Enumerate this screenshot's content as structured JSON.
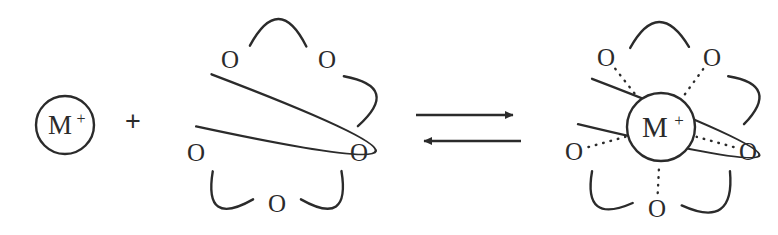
{
  "diagram": {
    "background_color": "#ffffff",
    "line_color": "#2b2b2b",
    "stroke_width": 2.4,
    "reactants": {
      "cation": {
        "label": "M",
        "charge": "+",
        "full_label": "M+",
        "center": {
          "x": 65,
          "y": 125
        },
        "radius": 29
      },
      "plus_operator": {
        "symbol": "+",
        "center": {
          "x": 133,
          "y": 121
        },
        "size": 27
      },
      "crown_ether": {
        "name": "crown-ether-ring",
        "oxygen_label": "O",
        "oxygen_count": 5,
        "center": {
          "x": 277,
          "y": 122
        },
        "radius": 81,
        "oxygen_positions": [
          {
            "name": "oxygen-top-left",
            "x": 230,
            "y": 59
          },
          {
            "name": "oxygen-top-right",
            "x": 327,
            "y": 59
          },
          {
            "name": "oxygen-left",
            "x": 196,
            "y": 152
          },
          {
            "name": "oxygen-right",
            "x": 359,
            "y": 152
          },
          {
            "name": "oxygen-bottom",
            "x": 277,
            "y": 203
          }
        ]
      }
    },
    "arrows": {
      "name": "equilibrium-arrows",
      "type": "reversible",
      "forward": {
        "x1": 416,
        "y1": 115,
        "x2": 521,
        "y2": 115,
        "direction": "right"
      },
      "reverse": {
        "x1": 521,
        "y1": 141,
        "x2": 416,
        "y2": 141,
        "direction": "left"
      }
    },
    "product": {
      "name": "crown-ether-cation-complex",
      "cation": {
        "label": "M",
        "charge": "+",
        "full_label": "M+",
        "center": {
          "x": 661,
          "y": 127
        },
        "radius": 34
      },
      "crown_ether": {
        "oxygen_label": "O",
        "oxygen_count": 5,
        "center": {
          "x": 661,
          "y": 125
        },
        "radius": 83,
        "oxygen_positions": [
          {
            "name": "oxygen-top-left",
            "x": 606,
            "y": 57
          },
          {
            "name": "oxygen-top-right",
            "x": 712,
            "y": 57
          },
          {
            "name": "oxygen-left",
            "x": 574,
            "y": 151
          },
          {
            "name": "oxygen-right",
            "x": 748,
            "y": 151
          },
          {
            "name": "oxygen-bottom",
            "x": 657,
            "y": 208
          }
        ]
      },
      "coordination_bonds": {
        "name": "dative-coordination-bonds",
        "count": 5,
        "style": "dotted"
      }
    }
  }
}
